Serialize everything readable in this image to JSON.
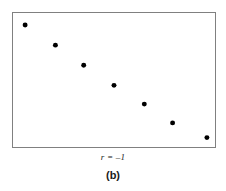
{
  "figure": {
    "panel_caption": "(b)",
    "correlation_label": "r = –1",
    "frame_color": "#808080",
    "point_color": "#000000",
    "background_color": "#ffffff"
  },
  "chart_data": {
    "type": "scatter",
    "title": "",
    "subtitle": "",
    "xlabel": "",
    "ylabel": "",
    "annotations": [
      "r = –1",
      "(b)"
    ],
    "legend": [],
    "grid": false,
    "axis_ticks": false,
    "xlim": [
      0,
      100
    ],
    "ylim": [
      0,
      100
    ],
    "series": [
      {
        "name": "perfect negative correlation",
        "marker": "filled-circle",
        "marker_size_px": 5,
        "color": "#000000",
        "x": [
          6,
          21,
          35,
          50,
          65,
          79,
          96
        ],
        "y": [
          91,
          76,
          61,
          46,
          32,
          18,
          7
        ]
      }
    ]
  }
}
